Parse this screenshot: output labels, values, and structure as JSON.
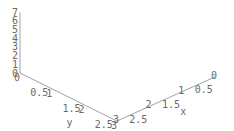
{
  "chart_data": {
    "type": "surface3d",
    "title": "",
    "xlabel": "x",
    "ylabel": "y",
    "zlabel": "",
    "x_range": [
      0,
      3
    ],
    "y_range": [
      0,
      3
    ],
    "z_range": [
      0,
      7
    ],
    "x_ticks": [
      "0",
      "0.5",
      "1",
      "1.5",
      "2",
      "2.5",
      "3"
    ],
    "y_ticks": [
      "0",
      "0.5",
      "1",
      "1.5",
      "2",
      "2.5",
      "3"
    ],
    "z_ticks": [
      "0",
      "1",
      "2",
      "3",
      "4",
      "5",
      "6",
      "7"
    ],
    "surface_description": "Wireframe ridge arching along y (peak near y≈1.57), highest (≈7) at x=3, lower toward x=0",
    "approx_function": "z ≈ sin(y)·(2.2 + 1.6·x)",
    "grid_lines": 24,
    "mesh_color": "#555555",
    "axis_color": "#8a8a8a",
    "label_color": "#6a6a6a",
    "background": "#ffffff"
  }
}
